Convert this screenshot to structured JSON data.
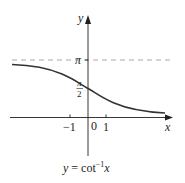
{
  "figure": {
    "caption_lhs": "y = cot",
    "caption_sup": "−1",
    "caption_var": "x",
    "axis_x_label": "x",
    "axis_y_label": "y",
    "tick_labels": {
      "neg_one": "−1",
      "zero": "0",
      "one": "1"
    },
    "y_labels": {
      "pi": "π",
      "half_num": "π",
      "half_den": "2"
    },
    "colors": {
      "curve": "#333333",
      "axis": "#231f20",
      "asymptote": "#9a9a9a"
    }
  }
}
